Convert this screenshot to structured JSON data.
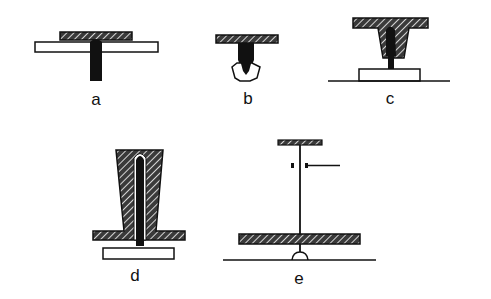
{
  "figure": {
    "colors": {
      "ink": "#111111",
      "background": "#ffffff",
      "hatch_fill": "#444444"
    },
    "panels": [
      {
        "id": "a",
        "label": "a",
        "parts": [
          "hatched cap plate",
          "white horizontal plate",
          "black vertical stem"
        ]
      },
      {
        "id": "b",
        "label": "b",
        "parts": [
          "hatched cap plate",
          "black tapered stem",
          "white cup/holder"
        ]
      },
      {
        "id": "c",
        "label": "c",
        "parts": [
          "hatched T-shaped tapered block",
          "black inner core",
          "white base block",
          "ground line"
        ]
      },
      {
        "id": "d",
        "label": "d",
        "parts": [
          "hatched tall tapered block with flange",
          "black thin inner rod",
          "white base plate"
        ]
      },
      {
        "id": "e",
        "label": "e",
        "parts": [
          "small hatched top plate",
          "thin vertical wire",
          "side pointer with two dots",
          "large hatched plate",
          "small dome",
          "ground line"
        ]
      }
    ]
  }
}
